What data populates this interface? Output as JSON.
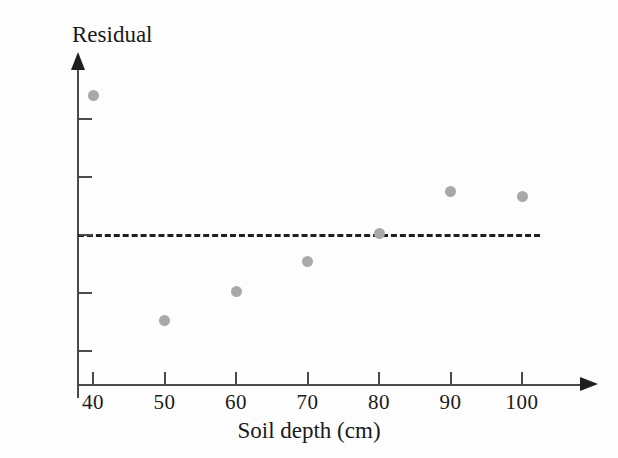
{
  "chart_data": {
    "type": "scatter",
    "title": "",
    "xlabel": "Soil depth (cm)",
    "ylabel": "Residual",
    "x": [
      40,
      50,
      60,
      70,
      80,
      90,
      100
    ],
    "values": [
      12.0,
      -7.4,
      -4.9,
      -2.3,
      0.1,
      3.7,
      3.3
    ],
    "points": [
      {
        "x": 40,
        "y": 12.0
      },
      {
        "x": 50,
        "y": -7.4
      },
      {
        "x": 60,
        "y": -4.9
      },
      {
        "x": 70,
        "y": -2.3
      },
      {
        "x": 80,
        "y": 0.1
      },
      {
        "x": 90,
        "y": 3.7
      },
      {
        "x": 100,
        "y": 3.3
      }
    ],
    "xlim": [
      35,
      106
    ],
    "ylim": [
      -13,
      14
    ],
    "xticks": [
      40,
      50,
      60,
      70,
      80,
      90,
      100
    ],
    "xtick_labels": [
      "40",
      "50",
      "60",
      "70",
      "80",
      "90",
      "100"
    ],
    "yticks": [
      10,
      5,
      0,
      -5,
      -10
    ],
    "ytick_labels": [
      "10",
      "5",
      "0",
      "−5",
      "−10"
    ],
    "grid": false,
    "legend": null,
    "annotations": [
      {
        "type": "reference-line",
        "orientation": "horizontal",
        "value": 0,
        "style": "dashed"
      }
    ],
    "marker_color": "#a9a9a9",
    "axis_color": "#4a4a4a",
    "reference_line_color": "#1f1f1f"
  }
}
